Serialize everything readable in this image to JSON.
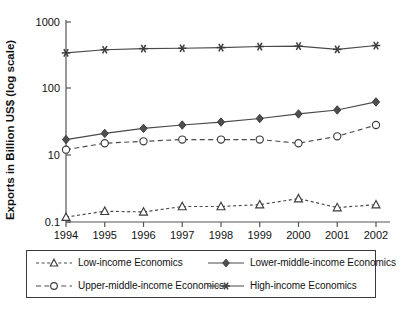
{
  "chart_data": {
    "type": "line",
    "title": "",
    "xlabel": "",
    "ylabel": "Exports in Billion US$ (log scale)",
    "scale": "log",
    "grid": false,
    "legend_position": "bottom",
    "x": [
      1994,
      1995,
      1996,
      1997,
      1998,
      1999,
      2000,
      2001,
      2002
    ],
    "xtick_labels": [
      "1994",
      "1995",
      "1996",
      "1997",
      "1998",
      "1999",
      "2000",
      "2001",
      "2002"
    ],
    "ytick_labels": [
      "1000",
      "100",
      "10",
      "0.1"
    ],
    "ytick_values": [
      1000,
      100,
      10,
      0.1
    ],
    "ylim": [
      0.1,
      1000
    ],
    "series": [
      {
        "name": "Low-income Economics",
        "marker": "triangle-open",
        "line": "dashed-fine",
        "values": [
          0.14,
          0.21,
          0.2,
          0.29,
          0.29,
          0.33,
          0.5,
          0.27,
          0.33
        ]
      },
      {
        "name": "Lower-middle-income Economics",
        "marker": "diamond-filled",
        "line": "solid",
        "values": [
          17,
          21,
          25,
          28,
          31,
          35,
          41,
          47,
          62
        ]
      },
      {
        "name": "Upper-middle-income Economics",
        "marker": "circle-open",
        "line": "dashed-wide",
        "values": [
          12,
          15,
          16,
          17,
          17,
          17,
          15,
          19,
          28
        ]
      },
      {
        "name": "High-income Economics",
        "marker": "asterisk",
        "line": "solid",
        "values": [
          340,
          380,
          395,
          400,
          410,
          425,
          430,
          385,
          440
        ]
      }
    ]
  },
  "legend": {
    "entries": [
      {
        "label": "Low-income Economics",
        "marker": "triangle-open",
        "line": "dashed-fine"
      },
      {
        "label": "Lower-middle-income Economics",
        "marker": "diamond-filled",
        "line": "solid"
      },
      {
        "label": "Upper-middle-income Economics",
        "marker": "circle-open",
        "line": "dashed-wide"
      },
      {
        "label": "High-income Economics",
        "marker": "asterisk",
        "line": "solid"
      }
    ]
  },
  "colors": {
    "line": "#4a4a4a",
    "axis": "#545454",
    "text": "#111111",
    "background": "#ffffff"
  }
}
